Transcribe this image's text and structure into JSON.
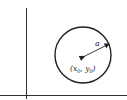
{
  "diagram": {
    "type": "circle-in-coordinate-axes",
    "center_label": "(x0, y0)",
    "center_label_x": "x",
    "center_label_x_sub": "0",
    "center_label_y": "y",
    "center_label_y_sub": "0",
    "radius_label": "a",
    "colors": {
      "stroke": "#222222",
      "background": "#ffffff"
    }
  }
}
